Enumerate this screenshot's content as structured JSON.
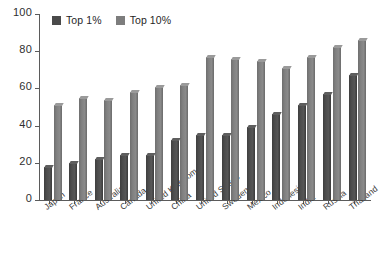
{
  "chart_data": {
    "type": "bar",
    "title": "",
    "subtitle": "",
    "xlabel": "",
    "ylabel": "",
    "ylim": [
      0,
      100
    ],
    "yticks": [
      0,
      20,
      40,
      60,
      80,
      100
    ],
    "grid": false,
    "legend_position": "top-left",
    "orientation": "vertical",
    "categories": [
      "Japan",
      "France",
      "Australia",
      "Canada",
      "United Kingdom",
      "China",
      "United States",
      "Sweden",
      "Mexico",
      "Indonesia",
      "India",
      "Russia",
      "Thailand"
    ],
    "series": [
      {
        "name": "Top 1%",
        "color": "#4a4a4a",
        "values": [
          18,
          20,
          22,
          24,
          24,
          32,
          35,
          35,
          39,
          46,
          51,
          57,
          67
        ]
      },
      {
        "name": "Top 10%",
        "color": "#7d7d7d",
        "values": [
          51,
          55,
          54,
          58,
          61,
          62,
          77,
          76,
          75,
          71,
          77,
          82,
          86
        ]
      }
    ]
  },
  "legend": {
    "items": [
      {
        "label": "Top 1%",
        "color": "#4a4a4a",
        "icon": "square-swatch-icon"
      },
      {
        "label": "Top 10%",
        "color": "#7d7d7d",
        "icon": "square-swatch-icon"
      }
    ]
  },
  "axes": {
    "y": {
      "ticks": [
        "0",
        "20",
        "40",
        "60",
        "80",
        "100"
      ]
    }
  }
}
